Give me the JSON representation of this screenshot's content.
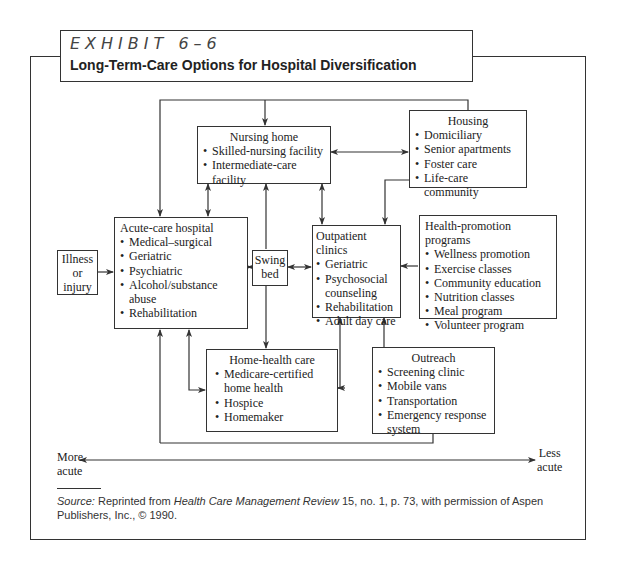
{
  "header": {
    "exhibit_label": "EXHIBIT 6–6",
    "title": "Long-Term-Care Options for Hospital Diversification"
  },
  "nodes": {
    "illness": {
      "lines": [
        "Illness",
        "or",
        "injury"
      ]
    },
    "acute_care": {
      "heading": "Acute-care hospital",
      "items": [
        "Medical–surgical",
        "Geriatric",
        "Psychiatric",
        "Alcohol/substance abuse",
        "Rehabilitation"
      ]
    },
    "nursing_home": {
      "heading": "Nursing home",
      "items": [
        "Skilled-nursing facility",
        "Intermediate-care facility"
      ]
    },
    "housing": {
      "heading": "Housing",
      "items": [
        "Domiciliary",
        "Senior apartments",
        "Foster care",
        "Life-care community"
      ]
    },
    "swing_bed": {
      "lines": [
        "Swing",
        "bed"
      ]
    },
    "outpatient": {
      "heading": "Outpatient clinics",
      "items": [
        "Geriatric",
        "Psychosocial counseling",
        "Rehabilitation",
        "Adult day care"
      ]
    },
    "health_promotion": {
      "heading": "Health-promotion programs",
      "items": [
        "Wellness promotion",
        "Exercise classes",
        "Community education",
        "Nutrition classes",
        "Meal program",
        "Volunteer program"
      ]
    },
    "home_health": {
      "heading": "Home-health care",
      "items": [
        "Medicare-certified home health",
        "Hospice",
        "Homemaker"
      ]
    },
    "outreach": {
      "heading": "Outreach",
      "items": [
        "Screening clinic",
        "Mobile vans",
        "Transportation",
        "Emergency response system"
      ]
    }
  },
  "axis": {
    "left_label": [
      "More",
      "acute"
    ],
    "right_label": [
      "Less",
      "acute"
    ]
  },
  "source": {
    "prefix": "Source:",
    "text1": " Reprinted from ",
    "journal": "Health Care Management Review",
    "text2": " 15, no. 1, p. 73, with permission of Aspen Publishers, Inc., © 1990."
  },
  "colors": {
    "line": "#333333",
    "background": "#ffffff"
  }
}
